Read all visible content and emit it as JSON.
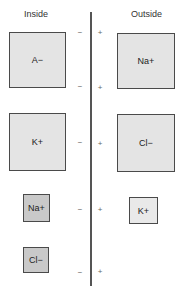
{
  "headers": {
    "inside": "Inside",
    "outside": "Outside"
  },
  "membrane": {
    "negative_sign": "−",
    "positive_sign": "+"
  },
  "inside_ions": [
    {
      "label": "A−",
      "size": "large"
    },
    {
      "label": "K+",
      "size": "large"
    },
    {
      "label": "Na+",
      "size": "small"
    },
    {
      "label": "Cl−",
      "size": "small"
    }
  ],
  "outside_ions": [
    {
      "label": "Na+",
      "size": "large"
    },
    {
      "label": "Cl−",
      "size": "large"
    },
    {
      "label": "K+",
      "size": "small"
    }
  ],
  "charge_marks": [
    {
      "left": "−",
      "right": "+"
    },
    {
      "left": "−",
      "right": "+"
    },
    {
      "left": "−",
      "right": "+"
    },
    {
      "left": "−",
      "right": "+"
    },
    {
      "left": "−",
      "right": "+"
    }
  ]
}
